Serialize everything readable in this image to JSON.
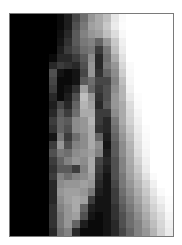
{
  "image": {
    "description": "Pixelated grayscale mosaic portrait",
    "cols": 21,
    "rows": 28,
    "rows_gray": [
      [
        0,
        0,
        0,
        0,
        0,
        0,
        10,
        30,
        70,
        110,
        150,
        170,
        190,
        230,
        250,
        255,
        255,
        255,
        255,
        255,
        255
      ],
      [
        0,
        0,
        0,
        0,
        0,
        0,
        10,
        30,
        80,
        120,
        160,
        170,
        200,
        235,
        252,
        255,
        255,
        255,
        255,
        255,
        255
      ],
      [
        0,
        0,
        0,
        0,
        0,
        0,
        15,
        40,
        90,
        130,
        150,
        160,
        190,
        220,
        248,
        255,
        255,
        255,
        255,
        255,
        255
      ],
      [
        0,
        0,
        0,
        0,
        0,
        0,
        20,
        50,
        90,
        120,
        130,
        100,
        150,
        200,
        240,
        255,
        255,
        255,
        255,
        255,
        255
      ],
      [
        0,
        0,
        0,
        0,
        0,
        0,
        30,
        60,
        80,
        110,
        120,
        60,
        120,
        190,
        235,
        255,
        255,
        255,
        255,
        255,
        255
      ],
      [
        0,
        0,
        0,
        0,
        0,
        10,
        40,
        40,
        60,
        90,
        140,
        40,
        110,
        170,
        225,
        255,
        255,
        255,
        255,
        255,
        255
      ],
      [
        0,
        0,
        0,
        0,
        0,
        40,
        60,
        50,
        40,
        80,
        150,
        40,
        120,
        150,
        215,
        250,
        255,
        255,
        255,
        255,
        255
      ],
      [
        0,
        0,
        0,
        0,
        0,
        80,
        20,
        10,
        20,
        70,
        150,
        50,
        100,
        140,
        205,
        248,
        255,
        255,
        255,
        255,
        255
      ],
      [
        0,
        0,
        0,
        0,
        0,
        70,
        10,
        10,
        20,
        90,
        110,
        70,
        70,
        130,
        190,
        245,
        255,
        255,
        255,
        255,
        255
      ],
      [
        0,
        0,
        0,
        0,
        0,
        60,
        10,
        20,
        50,
        160,
        100,
        60,
        80,
        140,
        180,
        240,
        255,
        255,
        255,
        255,
        255
      ],
      [
        0,
        0,
        0,
        0,
        0,
        40,
        10,
        30,
        80,
        190,
        150,
        50,
        80,
        150,
        180,
        232,
        252,
        255,
        255,
        255,
        255
      ],
      [
        0,
        0,
        0,
        0,
        0,
        30,
        70,
        40,
        100,
        180,
        160,
        40,
        90,
        150,
        170,
        220,
        250,
        255,
        255,
        255,
        255
      ],
      [
        0,
        0,
        0,
        0,
        0,
        40,
        90,
        60,
        110,
        170,
        170,
        60,
        60,
        140,
        170,
        215,
        245,
        255,
        255,
        255,
        255
      ],
      [
        0,
        0,
        0,
        0,
        0,
        60,
        100,
        90,
        140,
        150,
        180,
        60,
        40,
        120,
        170,
        210,
        240,
        255,
        255,
        255,
        255
      ],
      [
        0,
        0,
        0,
        0,
        0,
        50,
        100,
        80,
        140,
        150,
        170,
        50,
        40,
        110,
        160,
        200,
        235,
        252,
        255,
        255,
        255
      ],
      [
        0,
        0,
        0,
        0,
        0,
        20,
        120,
        60,
        110,
        140,
        170,
        100,
        30,
        100,
        150,
        190,
        230,
        250,
        255,
        255,
        255
      ],
      [
        0,
        0,
        0,
        0,
        0,
        60,
        150,
        80,
        130,
        140,
        170,
        140,
        20,
        90,
        140,
        180,
        225,
        248,
        255,
        255,
        255
      ],
      [
        0,
        0,
        0,
        0,
        0,
        80,
        120,
        110,
        140,
        150,
        160,
        130,
        30,
        90,
        140,
        175,
        220,
        245,
        255,
        255,
        255
      ],
      [
        0,
        0,
        0,
        0,
        0,
        60,
        100,
        130,
        150,
        140,
        170,
        70,
        40,
        80,
        130,
        170,
        210,
        240,
        255,
        255,
        255
      ],
      [
        0,
        0,
        0,
        0,
        0,
        50,
        90,
        90,
        60,
        130,
        170,
        60,
        30,
        80,
        130,
        165,
        200,
        235,
        255,
        255,
        255
      ],
      [
        0,
        0,
        0,
        0,
        0,
        60,
        130,
        110,
        130,
        140,
        160,
        50,
        20,
        80,
        120,
        160,
        190,
        225,
        250,
        255,
        255
      ],
      [
        0,
        0,
        0,
        0,
        0,
        40,
        140,
        150,
        150,
        160,
        150,
        40,
        20,
        70,
        120,
        150,
        180,
        210,
        240,
        255,
        255
      ],
      [
        0,
        0,
        0,
        0,
        0,
        40,
        150,
        160,
        160,
        150,
        120,
        30,
        20,
        60,
        110,
        140,
        170,
        200,
        230,
        250,
        255
      ],
      [
        0,
        0,
        0,
        0,
        0,
        40,
        140,
        160,
        170,
        160,
        60,
        20,
        20,
        60,
        100,
        130,
        160,
        190,
        220,
        240,
        252
      ],
      [
        0,
        0,
        0,
        0,
        0,
        50,
        130,
        150,
        170,
        100,
        30,
        20,
        20,
        50,
        90,
        120,
        150,
        180,
        210,
        230,
        250
      ],
      [
        0,
        0,
        0,
        0,
        0,
        50,
        120,
        150,
        160,
        80,
        20,
        10,
        20,
        50,
        80,
        110,
        140,
        170,
        200,
        220,
        245
      ],
      [
        0,
        0,
        0,
        0,
        0,
        50,
        120,
        150,
        100,
        30,
        10,
        10,
        20,
        40,
        80,
        110,
        130,
        160,
        190,
        215,
        240
      ],
      [
        0,
        0,
        0,
        0,
        0,
        40,
        110,
        130,
        40,
        10,
        10,
        10,
        20,
        40,
        70,
        100,
        130,
        150,
        180,
        210,
        235
      ]
    ]
  }
}
